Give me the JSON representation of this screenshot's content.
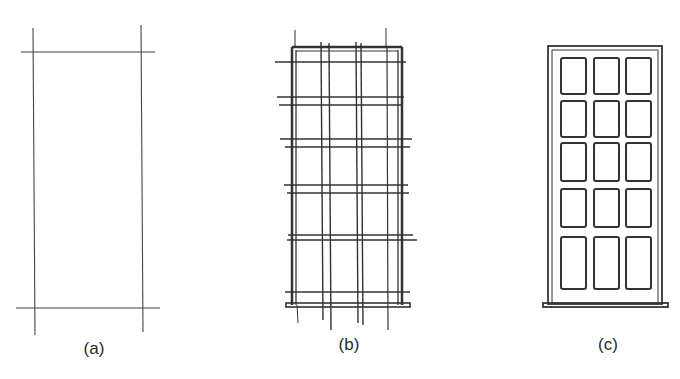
{
  "figure": {
    "panels": [
      {
        "id": "a",
        "label": "(a)",
        "description": "Construction lines: two vertical and two horizontal lines defining the outline"
      },
      {
        "id": "b",
        "label": "(b)",
        "description": "Grid of paired construction lines dividing frame into 3 columns and 5 rows with sill"
      },
      {
        "id": "c",
        "label": "(c)",
        "description": "Finished door/window with 3x5 panes, frame and sill"
      }
    ],
    "stroke_color": "#333333",
    "background": "#ffffff",
    "panes": {
      "columns": 3,
      "rows": 5
    }
  }
}
